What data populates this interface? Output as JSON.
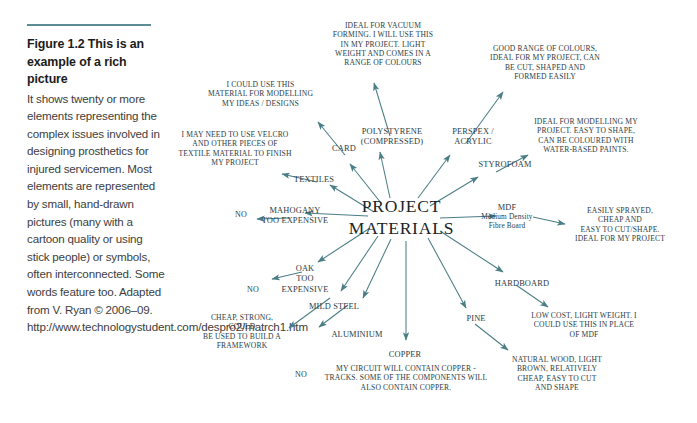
{
  "caption": {
    "title": "Figure 1.2  This is an example of a rich picture",
    "body": "It shows twenty or more elements representing the complex issues involved in designing prosthetics for injured servicemen. Most elements are represented by small, hand-drawn pictures (many with a cartoon quality or using stick people) or symbols, often interconnected. Some words feature too. Adapted from V. Ryan © 2006–09. http://www.technologystudent.com/despro2/matrch1.htm"
  },
  "diagram": {
    "center": "PROJECT\nMATERIALS",
    "accent_color": "#4a7d85",
    "text_color": "#2b3d45",
    "nodes": {
      "card": "CARD",
      "card_note": "I COULD USE THIS\nMATERIAL FOR MODELLING\nMY IDEAS / DESIGNS",
      "textiles": "TEXTILES",
      "textiles_note": "I MAY NEED TO USE VELCRO\nAND OTHER PIECES OF\nTEXTILE MATERIAL TO FINISH\nMY PROJECT",
      "polystyrene": "POLYSTYRENE\n(COMPRESSED)",
      "polystyrene_note": "IDEAL FOR VACUUM\nFORMING. I WILL USE THIS\nIN MY PROJECT. LIGHT\nWEIGHT AND COMES IN A\nRANGE OF COLOURS",
      "perspex": "PERSPEX /\nACRYLIC",
      "perspex_note": "GOOD RANGE OF COLOURS,\nIDEAL FOR MY PROJECT, CAN\nBE CUT, SHAPED AND\nFORMED EASILY",
      "styrofoam": "STYROFOAM",
      "styrofoam_note": "IDEAL FOR MODELLING MY\nPROJECT. EASY TO SHAPE,\nCAN BE COLOURED WITH\nWATER-BASED PAINTS.",
      "mdf": "MDF",
      "mdf_sub": "Medium Density\nFibre Board",
      "mdf_note": "EASILY SPRAYED,\nCHEAP AND\nEASY TO CUT/SHAPE.\nIDEAL FOR MY PROJECT",
      "hardboard": "HARDBOARD",
      "hardboard_note": "LOW COST, LIGHT WEIGHT. I\nCOULD USE THIS IN PLACE\nOF MDF",
      "pine": "PINE",
      "pine_note": "NATURAL WOOD, LIGHT\nBROWN, RELATIVELY\nCHEAP, EASY TO CUT\nAND SHAPE",
      "copper": "COPPER",
      "copper_note": "MY CIRCUIT WILL CONTAIN COPPER -\nTRACKS. SOME OF THE COMPONENTS WILL\nALSO CONTAIN COPPER.",
      "aluminium": "ALUMINIUM",
      "aluminium_no": "NO",
      "mild_steel": "MILD STEEL",
      "mild_steel_note": "CHEAP, STRONG,\nCOULD\nBE USED TO BUILD A\nFRAMEWORK",
      "oak": "OAK\nTOO EXPENSIVE",
      "oak_no": "NO",
      "mahogany": "MAHOGANY\nTOO EXPENSIVE",
      "mahogany_no": "NO"
    }
  }
}
